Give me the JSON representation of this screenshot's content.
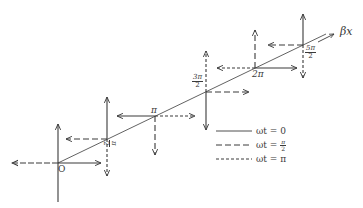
{
  "diagram": {
    "type": "traveling-wave-phasor-diagram",
    "axis": {
      "label": "βx",
      "start": [
        58,
        163
      ],
      "end": [
        333,
        31
      ]
    },
    "colors": {
      "ink": "#3a3a3a",
      "background": "#ffffff"
    },
    "nodes": [
      {
        "label": "O",
        "position": "0",
        "x": 58,
        "y": 163
      },
      {
        "label_num": "π",
        "label_den": "2",
        "position": "π/2",
        "x": 107,
        "y": 139
      },
      {
        "label": "π",
        "position": "π",
        "x": 155,
        "y": 116
      },
      {
        "label_num": "3π",
        "label_den": "2",
        "position": "3π/2",
        "x": 206,
        "y": 92
      },
      {
        "label": "2π",
        "position": "2π",
        "x": 255,
        "y": 68
      },
      {
        "label_num": "5π",
        "label_den": "2",
        "position": "5π/2",
        "x": 303,
        "y": 45
      }
    ],
    "legend": [
      {
        "style": "solid",
        "text": "ωt = 0"
      },
      {
        "style": "long-dash",
        "text": "ωt = π/2",
        "num": "π",
        "den": "2"
      },
      {
        "style": "short-dash",
        "text": "ωt = π"
      }
    ]
  }
}
